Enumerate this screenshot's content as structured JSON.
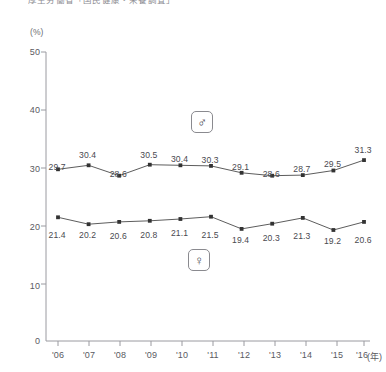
{
  "title": "厚生労働省「国民健康・栄養調査」",
  "axes": {
    "y_unit": "(%)",
    "y_ticks": [
      "50",
      "40",
      "30",
      "20",
      "10",
      "0"
    ],
    "x_unit": "(年)",
    "x_ticks": [
      "'06",
      "'07",
      "'08",
      "'09",
      "'10",
      "'11",
      "'12",
      "'13",
      "'14",
      "'15",
      "'16"
    ]
  },
  "legend": {
    "male_symbol": "♂",
    "male_name": "male-symbol",
    "female_symbol": "♀",
    "female_name": "female-symbol"
  },
  "chart_data": {
    "type": "line",
    "title": "厚生労働省「国民健康・栄養調査」",
    "xlabel": "(年)",
    "ylabel": "(%)",
    "ylim": [
      0,
      50
    ],
    "yticks": [
      0,
      10,
      20,
      30,
      40,
      50
    ],
    "grid": false,
    "legend_position": "inside-center",
    "categories": [
      "'06",
      "'07",
      "'08",
      "'09",
      "'10",
      "'11",
      "'12",
      "'13",
      "'14",
      "'15",
      "'16"
    ],
    "series": [
      {
        "name": "♂",
        "values": [
          29.7,
          30.4,
          28.6,
          30.5,
          30.4,
          30.3,
          29.1,
          28.6,
          28.7,
          29.5,
          31.3
        ],
        "labels": [
          "29.7",
          "30.4",
          "28.6",
          "30.5",
          "30.4",
          "30.3",
          "29.1",
          "28.6",
          "28.7",
          "29.5",
          "31.3"
        ],
        "marker": "square",
        "color": "#333333"
      },
      {
        "name": "♀",
        "values": [
          21.4,
          20.2,
          20.6,
          20.8,
          21.1,
          21.5,
          19.4,
          20.3,
          21.3,
          19.2,
          20.6
        ],
        "labels": [
          "21.4",
          "20.2",
          "20.6",
          "20.8",
          "21.1",
          "21.5",
          "19.4",
          "20.3",
          "21.3",
          "19.2",
          "20.6"
        ],
        "marker": "square",
        "color": "#333333"
      }
    ]
  }
}
